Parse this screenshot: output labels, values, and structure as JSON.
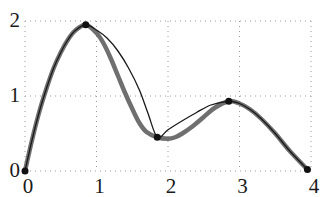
{
  "chart_data": {
    "type": "line",
    "title": "",
    "xlabel": "",
    "ylabel": "",
    "xlim": [
      -0.05,
      4.0
    ],
    "ylim": [
      -0.02,
      2.05
    ],
    "grid": true,
    "grid_style": "dotted",
    "legend": "none",
    "xticks": [
      0,
      1,
      2,
      3,
      4
    ],
    "yticks": [
      0,
      1,
      2
    ],
    "xtick_labels": [
      "0",
      "1",
      "2",
      "3",
      "4"
    ],
    "ytick_labels": [
      "0",
      "1",
      "2"
    ],
    "knots": {
      "name": "interpolation knots",
      "x": [
        0.0,
        0.85,
        1.85,
        2.85,
        3.95
      ],
      "y": [
        0.0,
        1.95,
        0.45,
        0.93,
        0.02
      ],
      "marker": "filled-circle",
      "marker_color": "#111111",
      "marker_size": 7
    },
    "series": [
      {
        "name": "thick-gray-spline",
        "color": "#6f6f6f",
        "width": 4.5,
        "x": [
          0.0,
          0.1,
          0.2,
          0.3,
          0.4,
          0.5,
          0.6,
          0.7,
          0.85,
          1.0,
          1.1,
          1.2,
          1.3,
          1.4,
          1.5,
          1.6,
          1.7,
          1.85,
          2.0,
          2.1,
          2.2,
          2.35,
          2.5,
          2.65,
          2.85,
          3.0,
          3.15,
          3.3,
          3.5,
          3.7,
          3.95
        ],
        "y": [
          0.0,
          0.42,
          0.79,
          1.1,
          1.37,
          1.58,
          1.75,
          1.87,
          1.95,
          1.84,
          1.7,
          1.5,
          1.27,
          1.04,
          0.83,
          0.64,
          0.52,
          0.45,
          0.43,
          0.45,
          0.5,
          0.6,
          0.72,
          0.84,
          0.93,
          0.9,
          0.82,
          0.7,
          0.5,
          0.27,
          0.02
        ]
      },
      {
        "name": "thin-black-interpolant",
        "color": "#1a1a1a",
        "width": 1.3,
        "x": [
          0.0,
          0.1,
          0.2,
          0.3,
          0.4,
          0.5,
          0.6,
          0.7,
          0.85,
          1.0,
          1.15,
          1.3,
          1.45,
          1.6,
          1.72,
          1.85,
          2.0,
          2.2,
          2.4,
          2.6,
          2.85,
          3.0,
          3.15,
          3.3,
          3.5,
          3.7,
          3.95
        ],
        "y": [
          0.0,
          0.42,
          0.79,
          1.1,
          1.37,
          1.58,
          1.75,
          1.87,
          1.95,
          1.88,
          1.77,
          1.6,
          1.37,
          1.08,
          0.77,
          0.45,
          0.55,
          0.67,
          0.78,
          0.88,
          0.93,
          0.9,
          0.82,
          0.7,
          0.5,
          0.27,
          0.02
        ]
      }
    ]
  }
}
